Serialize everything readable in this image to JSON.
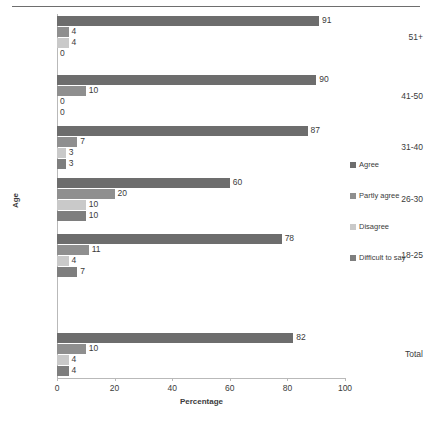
{
  "chart_data": {
    "type": "bar",
    "orientation": "horizontal",
    "title": "",
    "xlabel": "Percentage",
    "ylabel": "Age",
    "xlim": [
      0,
      100
    ],
    "xticks": [
      0,
      20,
      40,
      60,
      80,
      100
    ],
    "grid": false,
    "legend_position": "right",
    "categories": [
      "Total",
      "18-25",
      "26-30",
      "31-40",
      "41-50",
      "51+"
    ],
    "series": [
      {
        "name": "Agree",
        "color": "#6d6d6d",
        "values": [
          82,
          78,
          60,
          87,
          90,
          91
        ]
      },
      {
        "name": "Partly agree",
        "color": "#8f8f8f",
        "values": [
          10,
          11,
          20,
          7,
          10,
          4
        ]
      },
      {
        "name": "Disagree",
        "color": "#c9c9c9",
        "values": [
          4,
          4,
          10,
          3,
          0,
          4
        ]
      },
      {
        "name": "Difficult to say",
        "color": "#7e7e7e",
        "values": [
          4,
          7,
          10,
          3,
          0,
          0
        ]
      }
    ]
  },
  "legend": {
    "items": [
      {
        "label": "Agree",
        "color": "#6d6d6d"
      },
      {
        "label": "Partly agree",
        "color": "#8f8f8f"
      },
      {
        "label": "Disagree",
        "color": "#c9c9c9"
      },
      {
        "label": "Difficult to say",
        "color": "#7e7e7e"
      }
    ]
  },
  "axes": {
    "x_title": "Percentage",
    "y_title": "Age",
    "x_ticks": [
      "0",
      "20",
      "40",
      "60",
      "80",
      "100"
    ]
  },
  "groups": [
    {
      "category": "51+",
      "bars": [
        {
          "series": "Agree",
          "value": 91,
          "label": "91"
        },
        {
          "series": "Partly agree",
          "value": 4,
          "label": "4"
        },
        {
          "series": "Disagree",
          "value": 4,
          "label": "4"
        },
        {
          "series": "Difficult to say",
          "value": 0,
          "label": "0"
        }
      ]
    },
    {
      "category": "41-50",
      "bars": [
        {
          "series": "Agree",
          "value": 90,
          "label": "90"
        },
        {
          "series": "Partly agree",
          "value": 10,
          "label": "10"
        },
        {
          "series": "Disagree",
          "value": 0,
          "label": "0"
        },
        {
          "series": "Difficult to say",
          "value": 0,
          "label": "0"
        }
      ]
    },
    {
      "category": "31-40",
      "bars": [
        {
          "series": "Agree",
          "value": 87,
          "label": "87"
        },
        {
          "series": "Partly agree",
          "value": 7,
          "label": "7"
        },
        {
          "series": "Disagree",
          "value": 3,
          "label": "3"
        },
        {
          "series": "Difficult to say",
          "value": 3,
          "label": "3"
        }
      ]
    },
    {
      "category": "26-30",
      "bars": [
        {
          "series": "Agree",
          "value": 60,
          "label": "60"
        },
        {
          "series": "Partly agree",
          "value": 20,
          "label": "20"
        },
        {
          "series": "Disagree",
          "value": 10,
          "label": "10"
        },
        {
          "series": "Difficult to say",
          "value": 10,
          "label": "10"
        }
      ]
    },
    {
      "category": "18-25",
      "bars": [
        {
          "series": "Agree",
          "value": 78,
          "label": "78"
        },
        {
          "series": "Partly agree",
          "value": 11,
          "label": "11"
        },
        {
          "series": "Disagree",
          "value": 4,
          "label": "4"
        },
        {
          "series": "Difficult to say",
          "value": 7,
          "label": "7"
        }
      ]
    },
    {
      "category": "Total",
      "bars": [
        {
          "series": "Agree",
          "value": 82,
          "label": "82"
        },
        {
          "series": "Partly agree",
          "value": 10,
          "label": "10"
        },
        {
          "series": "Disagree",
          "value": 4,
          "label": "4"
        },
        {
          "series": "Difficult to say",
          "value": 4,
          "label": "4"
        }
      ]
    }
  ]
}
